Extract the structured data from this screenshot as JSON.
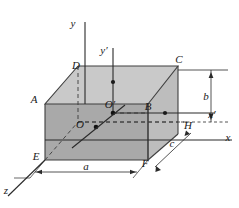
{
  "figure": {
    "background_color": "#ffffff",
    "faces": {
      "top_color": "#c9c9c9",
      "front_color": "#a8a8a8",
      "right_color": "#b8b8b8",
      "left_color": "#9e9e9e",
      "edge_color": "#4a4a4a"
    },
    "axes": [
      {
        "name": "y",
        "label": "y"
      },
      {
        "name": "y-prime",
        "label": "y′"
      },
      {
        "name": "x",
        "label": "x"
      },
      {
        "name": "x-prime",
        "label": "x′"
      },
      {
        "name": "z",
        "label": "z"
      }
    ],
    "vertices": [
      {
        "name": "A",
        "label": "A"
      },
      {
        "name": "B",
        "label": "B"
      },
      {
        "name": "C",
        "label": "C"
      },
      {
        "name": "D",
        "label": "D"
      },
      {
        "name": "E",
        "label": "E"
      },
      {
        "name": "F",
        "label": "F"
      },
      {
        "name": "H",
        "label": "H"
      }
    ],
    "origins": [
      {
        "name": "O",
        "label": "O"
      },
      {
        "name": "O-prime",
        "label": "O′"
      }
    ],
    "dimensions": [
      {
        "name": "a",
        "label": "a",
        "orientation": "horizontal-bottom"
      },
      {
        "name": "b",
        "label": "b",
        "orientation": "vertical-right"
      },
      {
        "name": "c",
        "label": "c",
        "orientation": "diagonal-depth"
      }
    ]
  }
}
